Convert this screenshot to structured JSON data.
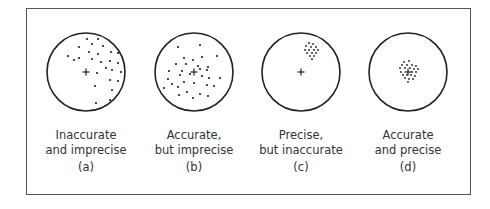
{
  "figure": {
    "panels": [
      {
        "id": "a",
        "title_line1": "Inaccurate",
        "title_line2": "and imprecise",
        "tag": "(a)",
        "center": [
          86,
          72
        ],
        "dots": [
          [
            87,
            39
          ],
          [
            98,
            39
          ],
          [
            79,
            47
          ],
          [
            92,
            44
          ],
          [
            103,
            46
          ],
          [
            89,
            52
          ],
          [
            98,
            54
          ],
          [
            111,
            52
          ],
          [
            118,
            53
          ],
          [
            68,
            56
          ],
          [
            79,
            58
          ],
          [
            92,
            59
          ],
          [
            101,
            62
          ],
          [
            110,
            61
          ],
          [
            118,
            63
          ],
          [
            74,
            60
          ],
          [
            106,
            68
          ],
          [
            112,
            70
          ],
          [
            121,
            72
          ],
          [
            97,
            73
          ],
          [
            110,
            80
          ],
          [
            118,
            81
          ],
          [
            95,
            86
          ],
          [
            112,
            90
          ],
          [
            96,
            103
          ],
          [
            110,
            100
          ]
        ]
      },
      {
        "id": "b",
        "title_line1": "Accurate,",
        "title_line2": "but imprecise",
        "tag": "(b)",
        "center": [
          194,
          72
        ],
        "dots": [
          [
            178,
            47
          ],
          [
            200,
            45
          ],
          [
            184,
            58
          ],
          [
            193,
            60
          ],
          [
            202,
            57
          ],
          [
            217,
            56
          ],
          [
            176,
            64
          ],
          [
            186,
            64
          ],
          [
            198,
            66
          ],
          [
            208,
            67
          ],
          [
            169,
            71
          ],
          [
            182,
            71
          ],
          [
            200,
            69
          ],
          [
            207,
            70
          ],
          [
            168,
            79
          ],
          [
            180,
            75
          ],
          [
            190,
            74
          ],
          [
            202,
            76
          ],
          [
            209,
            78
          ],
          [
            220,
            78
          ],
          [
            172,
            84
          ],
          [
            184,
            82
          ],
          [
            194,
            83
          ],
          [
            207,
            85
          ],
          [
            214,
            86
          ],
          [
            164,
            88
          ],
          [
            178,
            87
          ],
          [
            187,
            92
          ],
          [
            200,
            94
          ],
          [
            208,
            96
          ],
          [
            179,
            95
          ],
          [
            193,
            98
          ]
        ]
      },
      {
        "id": "c",
        "title_line1": "Precise,",
        "title_line2": "but inaccurate",
        "tag": "(c)",
        "center": [
          301,
          72
        ],
        "dots": [
          [
            309,
            43
          ],
          [
            313,
            44
          ],
          [
            306,
            46
          ],
          [
            311,
            47
          ],
          [
            316,
            47
          ],
          [
            305,
            50
          ],
          [
            309,
            50
          ],
          [
            314,
            50
          ],
          [
            318,
            50
          ],
          [
            307,
            53
          ],
          [
            312,
            53
          ],
          [
            316,
            53
          ],
          [
            310,
            56
          ],
          [
            314,
            56
          ],
          [
            312,
            59
          ]
        ]
      },
      {
        "id": "d",
        "title_line1": "Accurate",
        "title_line2": "and precise",
        "tag": "(d)",
        "center": [
          408,
          72
        ],
        "dots": [
          [
            404,
            62
          ],
          [
            409,
            61
          ],
          [
            402,
            65
          ],
          [
            407,
            65
          ],
          [
            412,
            65
          ],
          [
            416,
            66
          ],
          [
            400,
            68
          ],
          [
            405,
            68
          ],
          [
            410,
            68
          ],
          [
            414,
            69
          ],
          [
            418,
            69
          ],
          [
            401,
            72
          ],
          [
            412,
            72
          ],
          [
            416,
            72
          ],
          [
            403,
            75
          ],
          [
            407,
            75
          ],
          [
            411,
            75
          ],
          [
            415,
            76
          ],
          [
            405,
            78
          ],
          [
            409,
            79
          ],
          [
            413,
            79
          ],
          [
            408,
            82
          ]
        ]
      }
    ]
  }
}
